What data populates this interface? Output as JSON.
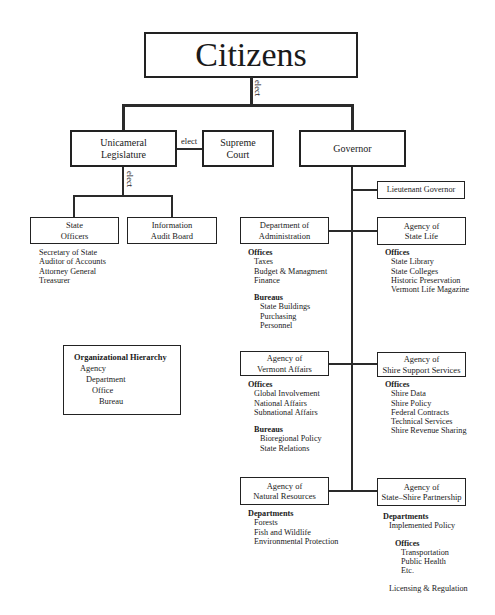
{
  "citizens": {
    "label": "Citizens",
    "elect_label": "elect"
  },
  "branches": {
    "legislature": "Unicameral Legislature",
    "legislature_lines": [
      "Unicameral",
      "Legislature"
    ],
    "supreme_court_lines": [
      "Supreme",
      "Court"
    ],
    "court_elect_label": "elect",
    "governor": "Governor",
    "legislature_elect_label": "elect"
  },
  "legislature_children": {
    "state_officers": {
      "title_lines": [
        "State",
        "Officers"
      ],
      "members": [
        "Secretary of State",
        "Auditor of Accounts",
        "Attorney General",
        "Treasurer"
      ]
    },
    "audit_board": {
      "title_lines": [
        "Information",
        "Audit Board"
      ]
    }
  },
  "lieutenant_governor": "Lieutenant Governor",
  "agencies": {
    "administration": {
      "title_lines": [
        "Department of",
        "Administration"
      ],
      "offices_heading": "Offices",
      "offices": [
        "Taxes",
        "Budget & Managment",
        "Finance"
      ],
      "bureaus_heading": "Bureaus",
      "bureaus": [
        "State Buildings",
        "Purchasing",
        "Personnel"
      ]
    },
    "state_life": {
      "title_lines": [
        "Agency of",
        "State Life"
      ],
      "offices_heading": "Offices",
      "offices": [
        "State Library",
        "State Colleges",
        "Historic Preservation",
        "Vermont Life Magazine"
      ]
    },
    "vermont_affairs": {
      "title_lines": [
        "Agency of",
        "Vermont Affairs"
      ],
      "offices_heading": "Offices",
      "offices": [
        "Global Involvement",
        "National Affairs",
        "Subnational Affairs"
      ],
      "bureaus_heading": "Bureaus",
      "bureaus": [
        "Bioregional Policy",
        "State Relations"
      ]
    },
    "shire_support": {
      "title_lines": [
        "Agency of",
        "Shire Support Services"
      ],
      "offices_heading": "Offices",
      "offices": [
        "Shire Data",
        "Shire Policy",
        "Federal Contracts",
        "Technical Services",
        "Shire Revenue Sharing"
      ]
    },
    "natural_resources": {
      "title_lines": [
        "Agency of",
        "Natural Resources"
      ],
      "departments_heading": "Departments",
      "departments": [
        "Forests",
        "Fish and Wildlife",
        "Environmental Protection"
      ]
    },
    "state_shire": {
      "title_lines": [
        "Agency of",
        "State–Shire Partnership"
      ],
      "departments_heading": "Departments",
      "departments": [
        "Implemented Policy"
      ],
      "offices_heading": "Offices",
      "offices": [
        "Transportation",
        "Public Health",
        "Etc."
      ],
      "extra": "Licensing & Regulation"
    }
  },
  "legend": {
    "title": "Organizational Hierarchy",
    "levels": [
      "Agency",
      "Department",
      "Office",
      "Bureau"
    ]
  }
}
